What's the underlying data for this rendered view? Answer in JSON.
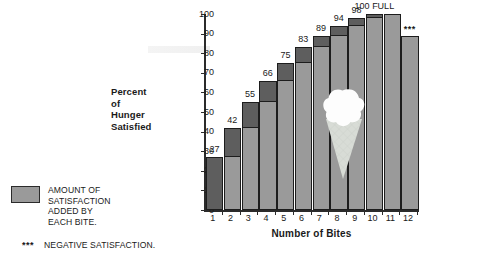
{
  "chart_data": {
    "type": "bar",
    "title": "",
    "xlabel": "Number of Bites",
    "ylabel": "Percent of Hunger Satisfied",
    "ylabel_lines": [
      "Percent",
      "of",
      "Hunger",
      "Satisfied"
    ],
    "categories": [
      "1",
      "2",
      "3",
      "4",
      "5",
      "6",
      "7",
      "8",
      "9",
      "10",
      "11",
      "12"
    ],
    "values": [
      27,
      42,
      55,
      66,
      75,
      83,
      89,
      94,
      98,
      100,
      100,
      89
    ],
    "value_labels": [
      "27",
      "42",
      "55",
      "66",
      "75",
      "83",
      "89",
      "94",
      "98",
      "100",
      "",
      ""
    ],
    "increments": [
      27,
      15,
      13,
      11,
      9,
      8,
      6,
      5,
      4,
      2,
      0,
      0
    ],
    "previous_values": [
      0,
      27,
      42,
      55,
      66,
      75,
      83,
      89,
      94,
      98,
      100,
      100
    ],
    "ylim": [
      0,
      100
    ],
    "yticks": [
      "0",
      "10",
      "20",
      "30",
      "40",
      "50",
      "60",
      "70",
      "80",
      "90",
      "100"
    ],
    "grid": false,
    "legend_position": "bottom-left",
    "series": [
      {
        "name": "Cumulative satisfaction",
        "color": "#9a9a9a",
        "values": [
          27,
          42,
          55,
          66,
          75,
          83,
          89,
          94,
          98,
          100,
          100,
          89
        ]
      },
      {
        "name": "Amount of satisfaction added by each bite",
        "color": "#5e5e5e",
        "values": [
          27,
          15,
          13,
          11,
          9,
          8,
          6,
          5,
          4,
          2,
          0,
          0
        ]
      }
    ],
    "annotations": [
      {
        "text": "100 FULL",
        "at_category": "10",
        "note": "label above bar 10"
      },
      {
        "text": "***",
        "at_category": "12",
        "note": "negative satisfaction marker above bar 12"
      }
    ]
  },
  "full_label": "100 FULL",
  "full_label_value": "100",
  "full_label_word": "FULL",
  "star_marker": "***",
  "legend": {
    "swatch_color": "#9a9a9a",
    "swatch_label": "AMOUNT OF\nSATISFACTION\nADDED BY\nEACH BITE.",
    "note_marker": "***",
    "note_label": "NEGATIVE SATISFACTION."
  },
  "colors": {
    "bar_light": "#9a9a9a",
    "bar_dark": "#5e5e5e",
    "outline": "#1d1d1d",
    "axis": "#2b2b2b",
    "text": "#1a1a1a",
    "cone": "#d8dcd6",
    "scoop": "#fdfdfd"
  }
}
